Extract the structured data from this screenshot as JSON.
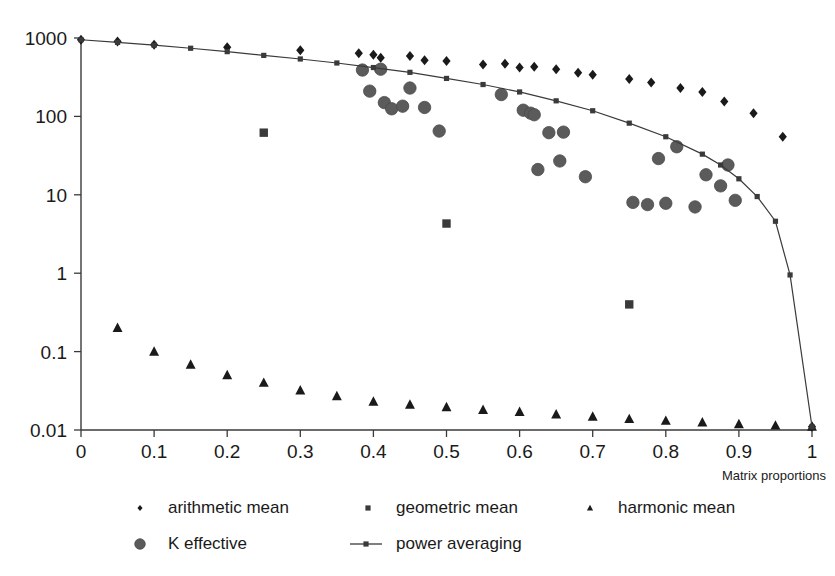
{
  "chart_data": {
    "type": "scatter",
    "title": "",
    "xlabel": "Matrix proportions",
    "ylabel": "",
    "xlim": [
      0,
      1
    ],
    "ylim": [
      0.01,
      1000
    ],
    "yscale": "log",
    "xscale": "linear",
    "grid": false,
    "legend_position": "bottom",
    "xticks": [
      "0",
      "0.1",
      "0.2",
      "0.3",
      "0.4",
      "0.5",
      "0.6",
      "0.7",
      "0.8",
      "0.9",
      "1"
    ],
    "xtick_values": [
      0,
      0.1,
      0.2,
      0.3,
      0.4,
      0.5,
      0.6,
      0.7,
      0.8,
      0.9,
      1
    ],
    "yticks": [
      "1000",
      "100",
      "10",
      "1",
      "0.1",
      "0.01"
    ],
    "ytick_values": [
      1000,
      100,
      10,
      1,
      0.1,
      0.01
    ],
    "series": [
      {
        "name": "arithmetic mean",
        "marker": "diamond",
        "color": "#1a1a1a",
        "points": [
          [
            0.0,
            950
          ],
          [
            0.05,
            900
          ],
          [
            0.1,
            820
          ],
          [
            0.2,
            760
          ],
          [
            0.3,
            700
          ],
          [
            0.38,
            640
          ],
          [
            0.4,
            610
          ],
          [
            0.41,
            560
          ],
          [
            0.45,
            590
          ],
          [
            0.47,
            520
          ],
          [
            0.5,
            510
          ],
          [
            0.55,
            460
          ],
          [
            0.58,
            470
          ],
          [
            0.6,
            420
          ],
          [
            0.62,
            430
          ],
          [
            0.65,
            400
          ],
          [
            0.68,
            360
          ],
          [
            0.7,
            340
          ],
          [
            0.75,
            300
          ],
          [
            0.78,
            270
          ],
          [
            0.82,
            230
          ],
          [
            0.85,
            205
          ],
          [
            0.88,
            155
          ],
          [
            0.92,
            110
          ],
          [
            0.96,
            55
          ],
          [
            1.0,
            0.011
          ]
        ]
      },
      {
        "name": "geometric mean",
        "marker": "square",
        "color": "#3a3a3a",
        "points": [
          [
            0.25,
            62
          ],
          [
            0.5,
            4.3
          ],
          [
            0.75,
            0.4
          ]
        ]
      },
      {
        "name": "harmonic mean",
        "marker": "triangle",
        "color": "#1a1a1a",
        "points": [
          [
            0.05,
            0.2
          ],
          [
            0.1,
            0.1
          ],
          [
            0.15,
            0.068
          ],
          [
            0.2,
            0.05
          ],
          [
            0.25,
            0.04
          ],
          [
            0.3,
            0.032
          ],
          [
            0.35,
            0.027
          ],
          [
            0.4,
            0.023
          ],
          [
            0.45,
            0.021
          ],
          [
            0.5,
            0.0195
          ],
          [
            0.55,
            0.018
          ],
          [
            0.6,
            0.017
          ],
          [
            0.65,
            0.0158
          ],
          [
            0.7,
            0.0148
          ],
          [
            0.75,
            0.0138
          ],
          [
            0.8,
            0.0131
          ],
          [
            0.85,
            0.0125
          ],
          [
            0.9,
            0.0119
          ],
          [
            0.95,
            0.0114
          ],
          [
            1.0,
            0.011
          ]
        ]
      },
      {
        "name": "K effective",
        "marker": "circle",
        "color": "#5b5b5b",
        "points": [
          [
            0.385,
            390
          ],
          [
            0.395,
            210
          ],
          [
            0.41,
            400
          ],
          [
            0.415,
            150
          ],
          [
            0.425,
            125
          ],
          [
            0.44,
            135
          ],
          [
            0.45,
            230
          ],
          [
            0.47,
            130
          ],
          [
            0.49,
            65
          ],
          [
            0.575,
            190
          ],
          [
            0.605,
            120
          ],
          [
            0.615,
            110
          ],
          [
            0.62,
            105
          ],
          [
            0.625,
            21
          ],
          [
            0.64,
            62
          ],
          [
            0.655,
            27
          ],
          [
            0.66,
            63
          ],
          [
            0.69,
            17
          ],
          [
            0.755,
            8.0
          ],
          [
            0.775,
            7.5
          ],
          [
            0.79,
            29
          ],
          [
            0.8,
            7.8
          ],
          [
            0.815,
            41
          ],
          [
            0.84,
            7.0
          ],
          [
            0.855,
            18
          ],
          [
            0.875,
            13
          ],
          [
            0.885,
            24
          ],
          [
            0.895,
            8.5
          ]
        ]
      },
      {
        "name": "power averaging",
        "marker": "line-square",
        "color": "#3a3a3a",
        "points": [
          [
            0.0,
            950
          ],
          [
            0.05,
            880
          ],
          [
            0.1,
            810
          ],
          [
            0.15,
            740
          ],
          [
            0.2,
            670
          ],
          [
            0.25,
            600
          ],
          [
            0.3,
            540
          ],
          [
            0.35,
            480
          ],
          [
            0.4,
            420
          ],
          [
            0.45,
            365
          ],
          [
            0.5,
            305
          ],
          [
            0.55,
            255
          ],
          [
            0.6,
            205
          ],
          [
            0.65,
            158
          ],
          [
            0.7,
            118
          ],
          [
            0.75,
            82
          ],
          [
            0.8,
            55
          ],
          [
            0.85,
            33
          ],
          [
            0.875,
            24
          ],
          [
            0.9,
            16
          ],
          [
            0.925,
            9.5
          ],
          [
            0.95,
            4.6
          ],
          [
            0.97,
            0.95
          ],
          [
            1.0,
            0.011
          ]
        ]
      }
    ]
  },
  "axis": {
    "x_title": "Matrix proportions"
  },
  "legend": {
    "entries": [
      {
        "label": "arithmetic mean",
        "marker": "diamond",
        "color": "#1a1a1a"
      },
      {
        "label": "geometric mean",
        "marker": "square",
        "color": "#3a3a3a"
      },
      {
        "label": "harmonic mean",
        "marker": "triangle",
        "color": "#1a1a1a"
      },
      {
        "label": "K effective",
        "marker": "circle",
        "color": "#5b5b5b"
      },
      {
        "label": "power averaging",
        "marker": "line-square",
        "color": "#3a3a3a"
      }
    ]
  }
}
